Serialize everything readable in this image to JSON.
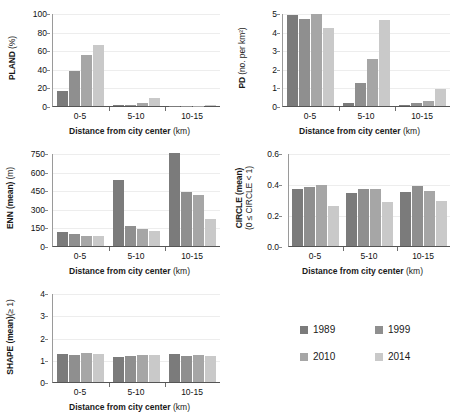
{
  "figure": {
    "xlabel_main": "Distance from city center",
    "xlabel_unit": "(km)",
    "categories": [
      "0-5",
      "5-10",
      "10-15"
    ]
  },
  "legend": {
    "position": "bottom-right",
    "items": [
      {
        "label": "1989",
        "color": "#7b7b7b"
      },
      {
        "label": "1999",
        "color": "#8f8f8f"
      },
      {
        "label": "2010",
        "color": "#a6a6a6"
      },
      {
        "label": "2014",
        "color": "#c9c9c9"
      }
    ]
  },
  "chart_data": [
    {
      "type": "bar",
      "title": "",
      "ylabel_main": "PLAND",
      "ylabel_unit": "(%)",
      "xlabel": "Distance from city center (km)",
      "categories": [
        "0-5",
        "5-10",
        "10-15"
      ],
      "ylim": [
        0,
        100
      ],
      "yticks": [
        "0",
        "20",
        "40",
        "60",
        "80",
        "100"
      ],
      "grid": true,
      "series": [
        {
          "name": "1989",
          "values": [
            16.5,
            0.6,
            0.1
          ]
        },
        {
          "name": "1999",
          "values": [
            38.0,
            1.2,
            0.1
          ]
        },
        {
          "name": "2010",
          "values": [
            54.5,
            3.2,
            0.2
          ]
        },
        {
          "name": "2014",
          "values": [
            66.0,
            8.8,
            0.9
          ]
        }
      ]
    },
    {
      "type": "bar",
      "title": "",
      "ylabel_main": "PD",
      "ylabel_unit": "(no. per km²)",
      "xlabel": "Distance from city center (km)",
      "categories": [
        "0-5",
        "5-10",
        "10-15"
      ],
      "ylim": [
        0,
        5
      ],
      "yticks": [
        "0",
        "1",
        "2",
        "3",
        "4",
        "5"
      ],
      "grid": true,
      "series": [
        {
          "name": "1989",
          "values": [
            4.9,
            0.16,
            0.04
          ]
        },
        {
          "name": "1999",
          "values": [
            4.68,
            1.25,
            0.16
          ]
        },
        {
          "name": "2010",
          "values": [
            4.94,
            2.52,
            0.29
          ]
        },
        {
          "name": "2014",
          "values": [
            4.22,
            4.65,
            0.93
          ]
        }
      ]
    },
    {
      "type": "bar",
      "title": "",
      "ylabel_main": "ENN (mean)",
      "ylabel_unit": "(m)",
      "xlabel": "Distance from city center (km)",
      "categories": [
        "0-5",
        "5-10",
        "10-15"
      ],
      "ylim": [
        0,
        750
      ],
      "yticks": [
        "0",
        "150",
        "300",
        "450",
        "600",
        "750"
      ],
      "grid": true,
      "series": [
        {
          "name": "1989",
          "values": [
            115,
            530,
            748
          ]
        },
        {
          "name": "1999",
          "values": [
            98,
            165,
            432
          ]
        },
        {
          "name": "2010",
          "values": [
            82,
            135,
            408
          ]
        },
        {
          "name": "2014",
          "values": [
            78,
            120,
            218
          ]
        }
      ]
    },
    {
      "type": "bar",
      "title": "",
      "ylabel_main": "CIRCLE (mean)",
      "ylabel_unit": "(0 ≤ CIRCLE < 1)",
      "xlabel": "Distance from city center (km)",
      "categories": [
        "0-5",
        "5-10",
        "10-15"
      ],
      "ylim": [
        0,
        0.6
      ],
      "yticks": [
        "0.0",
        "0.2",
        "0.4",
        "0.6"
      ],
      "grid": true,
      "series": [
        {
          "name": "1989",
          "values": [
            0.368,
            0.345,
            0.348
          ]
        },
        {
          "name": "1999",
          "values": [
            0.383,
            0.37,
            0.388
          ]
        },
        {
          "name": "2010",
          "values": [
            0.396,
            0.37,
            0.354
          ]
        },
        {
          "name": "2014",
          "values": [
            0.258,
            0.285,
            0.288
          ]
        }
      ]
    },
    {
      "type": "bar",
      "title": "",
      "ylabel_main": "SHAPE (mean)",
      "ylabel_unit": "(≥ 1)",
      "xlabel": "Distance from city center (km)",
      "categories": [
        "0-5",
        "5-10",
        "10-15"
      ],
      "ylim": [
        0,
        4
      ],
      "yticks": [
        "0",
        "1",
        "2",
        "3",
        "4"
      ],
      "grid": true,
      "series": [
        {
          "name": "1989",
          "values": [
            1.24,
            1.14,
            1.25
          ]
        },
        {
          "name": "1999",
          "values": [
            1.22,
            1.17,
            1.18
          ]
        },
        {
          "name": "2010",
          "values": [
            1.29,
            1.22,
            1.2
          ]
        },
        {
          "name": "2014",
          "values": [
            1.26,
            1.21,
            1.17
          ]
        }
      ]
    }
  ]
}
